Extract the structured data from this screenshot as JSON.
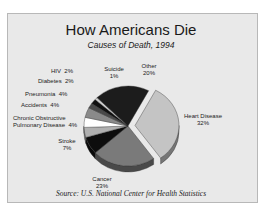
{
  "chart_data": {
    "type": "pie",
    "title": "How Americans Die",
    "subtitle": "Causes of Death, 1994",
    "source": "Source: U.S. National Center for Health Statistics",
    "categories": [
      "Heart Disease",
      "Cancer",
      "Stroke",
      "Chronic Obstructive Pulmonary Disease",
      "Accidents",
      "Pneumonia",
      "Diabetes",
      "HIV",
      "Suicide",
      "Other"
    ],
    "values": [
      32,
      23,
      7,
      4,
      4,
      4,
      2,
      2,
      1,
      20
    ],
    "unit": "%",
    "exploded": [
      "Heart Disease"
    ],
    "style": "3d-tilted",
    "colors": [
      "#c4c4c4",
      "#7a7a7a",
      "#0d0d0d",
      "#b0b0b0",
      "#ffffff",
      "#8a8a8a",
      "#4a4a4a",
      "#111111",
      "#d0d0d0",
      "#1c1c1c"
    ]
  },
  "labels": {
    "heart": {
      "name": "Heart Disease",
      "value": "32%"
    },
    "cancer": {
      "name": "Cancer",
      "value": "23%"
    },
    "stroke": {
      "name": "Stroke",
      "value": "7%"
    },
    "copd": {
      "name1": "Chronic Obstructive",
      "name2": "Pulmonary Disease",
      "value": "4%"
    },
    "accidents": {
      "name": "Accidents",
      "value": "4%"
    },
    "pneumonia": {
      "name": "Pneumonia",
      "value": "4%"
    },
    "diabetes": {
      "name": "Diabetes",
      "value": "2%"
    },
    "hiv": {
      "name": "HIV",
      "value": "2%"
    },
    "suicide": {
      "name": "Suicide",
      "value": "1%"
    },
    "other": {
      "name": "Other",
      "value": "20%"
    }
  }
}
